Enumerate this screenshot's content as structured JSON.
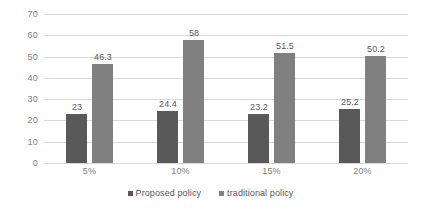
{
  "chart_data": {
    "type": "bar",
    "title": "",
    "subtitle": "",
    "xlabel": "",
    "ylabel": "",
    "categories": [
      "5%",
      "10%",
      "15%",
      "20%"
    ],
    "series": [
      {
        "name": "Proposed policy",
        "color": "#595959",
        "values": [
          23,
          24.4,
          23.2,
          25.2
        ],
        "labels": [
          "23",
          "24.4",
          "23.2",
          "25.2"
        ]
      },
      {
        "name": "traditional policy",
        "color": "#808080",
        "values": [
          46.3,
          58,
          51.5,
          50.2
        ],
        "labels": [
          "46.3",
          "58",
          "51.5",
          "50.2"
        ]
      }
    ],
    "ylim": [
      0,
      70
    ],
    "ytick_step": 10,
    "ytick_labels": [
      "0",
      "10",
      "20",
      "30",
      "40",
      "50",
      "60",
      "70"
    ],
    "grid": true,
    "grid_color": "#d9d9d9",
    "legend_position": "bottom",
    "background": "#ffffff",
    "axis_text_color": "#808080",
    "label_text_color": "#595959"
  }
}
